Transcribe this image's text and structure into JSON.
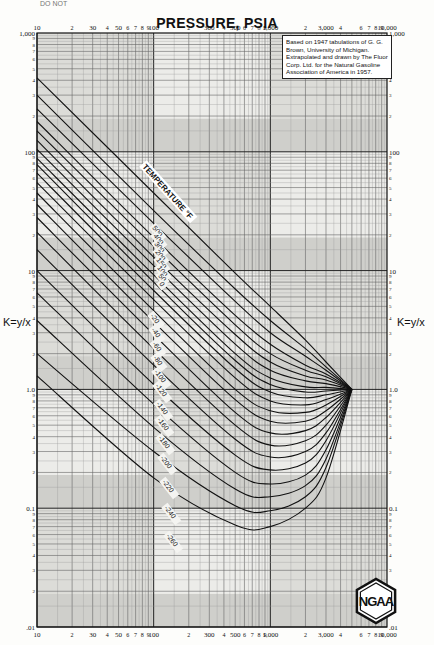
{
  "page": {
    "header_fragment": "DO  NOT"
  },
  "chart_data": {
    "type": "line",
    "title": "PRESSURE, PSIA",
    "xlabel": "PRESSURE, PSIA",
    "ylabel": "K=y/x",
    "ylabel_right": "K=y/x",
    "x_scale": "log",
    "y_scale": "log",
    "xlim": [
      10,
      10000
    ],
    "ylim": [
      0.01,
      1000
    ],
    "x_major_ticks": [
      "10",
      "100",
      "1,000",
      "10,000"
    ],
    "x_tick_labels_top": [
      "10",
      "2",
      "30",
      "4",
      "50",
      "6",
      "7",
      "8",
      "9",
      "100",
      "2",
      "300",
      "4",
      "500",
      "6",
      "7",
      "8",
      "9",
      "1,000",
      "2",
      "3,000",
      "4",
      "6",
      "7",
      "8",
      "9",
      "10,000"
    ],
    "x_tick_labels_bottom": [
      "10",
      "2",
      "30",
      "4",
      "50",
      "6",
      "7",
      "8",
      "9",
      "100",
      "2",
      "300",
      "4",
      "500",
      "6",
      "7",
      "8",
      "9",
      "1,000",
      "2",
      "3,000",
      "4",
      "6",
      "7",
      "8",
      "9",
      "10,000"
    ],
    "y_major_ticks": [
      "1,000",
      "100",
      "10",
      "1.0",
      "0.1",
      ".01"
    ],
    "y_minor_tick_labels": [
      "9",
      "8",
      "7",
      "6",
      "5",
      "4",
      "3",
      "2"
    ],
    "grid": true,
    "legend_label": "TEMPERATURE °F",
    "convergence_pressure_psia": 5000,
    "annotation": "Based on 1947 tabulations of G. G. Brown, University of Michigan. Extrapolated and drawn by The Fluor Corp. Ltd. for the Natural Gasoline Association of America in 1957.",
    "logo": "NGAA",
    "series": [
      {
        "name": "500",
        "points": [
          [
            10,
            420
          ],
          [
            100,
            45
          ],
          [
            500,
            9.5
          ],
          [
            1000,
            5
          ],
          [
            2000,
            2.6
          ],
          [
            3000,
            1.7
          ],
          [
            5000,
            1.0
          ]
        ]
      },
      {
        "name": "400",
        "points": [
          [
            10,
            300
          ],
          [
            100,
            32
          ],
          [
            500,
            7
          ],
          [
            1000,
            3.8
          ],
          [
            2000,
            2.2
          ],
          [
            3000,
            1.55
          ],
          [
            5000,
            1.0
          ]
        ]
      },
      {
        "name": "300",
        "points": [
          [
            10,
            230
          ],
          [
            100,
            25
          ],
          [
            500,
            5.5
          ],
          [
            1000,
            3.0
          ],
          [
            2000,
            1.9
          ],
          [
            3000,
            1.45
          ],
          [
            5000,
            1.0
          ]
        ]
      },
      {
        "name": "200",
        "points": [
          [
            10,
            180
          ],
          [
            100,
            19
          ],
          [
            500,
            4.2
          ],
          [
            1000,
            2.4
          ],
          [
            2000,
            1.6
          ],
          [
            3000,
            1.35
          ],
          [
            5000,
            1.0
          ]
        ]
      },
      {
        "name": "150",
        "points": [
          [
            10,
            150
          ],
          [
            100,
            16
          ],
          [
            500,
            3.5
          ],
          [
            1000,
            2.0
          ],
          [
            2000,
            1.45
          ],
          [
            3000,
            1.28
          ],
          [
            5000,
            1.0
          ]
        ]
      },
      {
        "name": "100",
        "points": [
          [
            10,
            125
          ],
          [
            100,
            13
          ],
          [
            500,
            2.9
          ],
          [
            1000,
            1.7
          ],
          [
            2000,
            1.3
          ],
          [
            3000,
            1.2
          ],
          [
            5000,
            1.0
          ]
        ]
      },
      {
        "name": "50",
        "points": [
          [
            10,
            105
          ],
          [
            100,
            11
          ],
          [
            500,
            2.4
          ],
          [
            1000,
            1.45
          ],
          [
            2000,
            1.18
          ],
          [
            3000,
            1.12
          ],
          [
            5000,
            1.0
          ]
        ]
      },
      {
        "name": "0",
        "points": [
          [
            10,
            88
          ],
          [
            100,
            9.2
          ],
          [
            500,
            2.0
          ],
          [
            1000,
            1.25
          ],
          [
            2000,
            1.05
          ],
          [
            3000,
            1.04
          ],
          [
            5000,
            1.0
          ]
        ]
      },
      {
        "name": "-20",
        "points": [
          [
            10,
            78
          ],
          [
            100,
            8.0
          ],
          [
            500,
            1.75
          ],
          [
            1000,
            1.1
          ],
          [
            2000,
            0.95
          ],
          [
            3000,
            0.97
          ],
          [
            5000,
            1.0
          ]
        ]
      },
      {
        "name": "-40",
        "points": [
          [
            10,
            66
          ],
          [
            100,
            6.8
          ],
          [
            500,
            1.5
          ],
          [
            1000,
            0.95
          ],
          [
            2000,
            0.85
          ],
          [
            3000,
            0.9
          ],
          [
            5000,
            1.0
          ]
        ]
      },
      {
        "name": "-60",
        "points": [
          [
            10,
            55
          ],
          [
            100,
            5.7
          ],
          [
            500,
            1.25
          ],
          [
            1000,
            0.8
          ],
          [
            2000,
            0.74
          ],
          [
            3000,
            0.82
          ],
          [
            5000,
            1.0
          ]
        ]
      },
      {
        "name": "-80",
        "points": [
          [
            10,
            45
          ],
          [
            100,
            4.6
          ],
          [
            500,
            1.0
          ],
          [
            1000,
            0.66
          ],
          [
            2000,
            0.64
          ],
          [
            3000,
            0.74
          ],
          [
            5000,
            1.0
          ]
        ]
      },
      {
        "name": "-100",
        "points": [
          [
            10,
            36
          ],
          [
            100,
            3.7
          ],
          [
            500,
            0.82
          ],
          [
            1000,
            0.54
          ],
          [
            2000,
            0.54
          ],
          [
            3000,
            0.66
          ],
          [
            5000,
            1.0
          ]
        ]
      },
      {
        "name": "-120",
        "points": [
          [
            10,
            28
          ],
          [
            100,
            2.9
          ],
          [
            500,
            0.64
          ],
          [
            1000,
            0.43
          ],
          [
            2000,
            0.45
          ],
          [
            3000,
            0.58
          ],
          [
            5000,
            1.0
          ]
        ]
      },
      {
        "name": "-140",
        "points": [
          [
            10,
            21
          ],
          [
            100,
            2.2
          ],
          [
            500,
            0.5
          ],
          [
            1000,
            0.34
          ],
          [
            2000,
            0.37
          ],
          [
            3000,
            0.5
          ],
          [
            5000,
            1.0
          ]
        ]
      },
      {
        "name": "-160",
        "points": [
          [
            10,
            15
          ],
          [
            100,
            1.6
          ],
          [
            500,
            0.38
          ],
          [
            1000,
            0.27
          ],
          [
            2000,
            0.3
          ],
          [
            3000,
            0.43
          ],
          [
            5000,
            1.0
          ]
        ]
      },
      {
        "name": "-180",
        "points": [
          [
            10,
            10
          ],
          [
            100,
            1.1
          ],
          [
            500,
            0.28
          ],
          [
            1000,
            0.21
          ],
          [
            2000,
            0.24
          ],
          [
            3000,
            0.37
          ],
          [
            5000,
            1.0
          ]
        ]
      },
      {
        "name": "-200",
        "points": [
          [
            10,
            6.5
          ],
          [
            100,
            0.75
          ],
          [
            500,
            0.2
          ],
          [
            1000,
            0.16
          ],
          [
            2000,
            0.19
          ],
          [
            3000,
            0.31
          ],
          [
            5000,
            1.0
          ]
        ]
      },
      {
        "name": "-220",
        "points": [
          [
            10,
            3.8
          ],
          [
            100,
            0.48
          ],
          [
            500,
            0.145
          ],
          [
            1000,
            0.125
          ],
          [
            2000,
            0.155
          ],
          [
            3000,
            0.26
          ],
          [
            5000,
            1.0
          ]
        ]
      },
      {
        "name": "-240",
        "points": [
          [
            10,
            2.0
          ],
          [
            100,
            0.3
          ],
          [
            500,
            0.105
          ],
          [
            1000,
            0.095
          ],
          [
            2000,
            0.125
          ],
          [
            3000,
            0.22
          ],
          [
            5000,
            1.0
          ]
        ]
      },
      {
        "name": "-260",
        "points": [
          [
            10,
            1.3
          ],
          [
            100,
            0.18
          ],
          [
            500,
            0.072
          ],
          [
            1000,
            0.07
          ],
          [
            2000,
            0.1
          ],
          [
            3000,
            0.18
          ],
          [
            5000,
            1.0
          ]
        ]
      }
    ]
  }
}
